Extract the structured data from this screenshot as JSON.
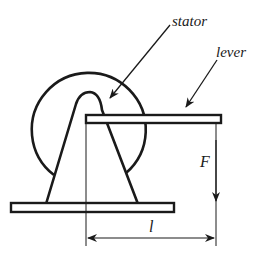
{
  "diagram": {
    "type": "mechanical-schematic",
    "labels": {
      "stator": "stator",
      "lever": "lever",
      "force": "F",
      "length": "l"
    },
    "colors": {
      "ink": "#1a1a1a",
      "background": "#ffffff"
    },
    "components": [
      {
        "id": "stator",
        "shape": "circle-arc",
        "description": "Large circular stator housing partially hidden by support"
      },
      {
        "id": "support",
        "shape": "A-frame",
        "description": "Triangular support with rounded apex pivot"
      },
      {
        "id": "base",
        "shape": "rectangle",
        "description": "Flat base plate"
      },
      {
        "id": "lever",
        "shape": "rectangle",
        "description": "Horizontal lever arm attached at pivot"
      },
      {
        "id": "force-arrow",
        "shape": "arrow",
        "direction": "down",
        "label": "F"
      },
      {
        "id": "length-dimension",
        "shape": "double-arrow",
        "direction": "horizontal",
        "label": "l"
      }
    ]
  }
}
